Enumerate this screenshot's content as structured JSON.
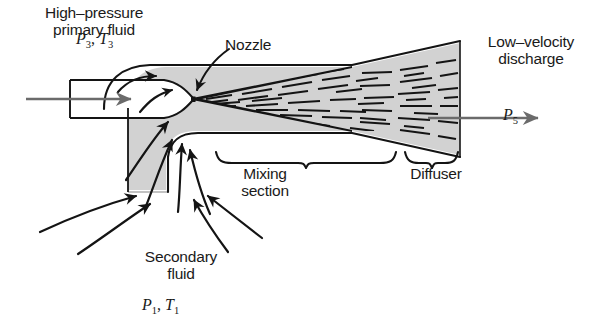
{
  "diagram": {
    "fill_color": "#d2d2d2",
    "line_color": "#1a1a1a",
    "arrow_color": "#6b6b6b",
    "background": "#ffffff"
  },
  "labels": {
    "high_pressure_line1": "High–pressure",
    "high_pressure_line2": "primary fluid",
    "nozzle": "Nozzle",
    "low_velocity_line1": "Low–velocity",
    "low_velocity_line2": "discharge",
    "mixing_line1": "Mixing",
    "mixing_line2": "section",
    "diffuser": "Diffuser",
    "secondary_line1": "Secondary",
    "secondary_line2": "fluid"
  },
  "symbols": {
    "primary_pressure": "P",
    "primary_pressure_sub": "3",
    "primary_temp": "T",
    "primary_temp_sub": "3",
    "secondary_pressure": "P",
    "secondary_pressure_sub": "1",
    "secondary_temp": "T",
    "secondary_temp_sub": "1",
    "discharge_pressure": "P",
    "discharge_pressure_sub": "5",
    "separator": ", "
  },
  "callouts": [
    {
      "name": "nozzle-leader",
      "from": [
        228,
        48
      ],
      "to": [
        196,
        92
      ]
    },
    {
      "name": "mixing-brace",
      "span": [
        215,
        396
      ],
      "y": 152
    },
    {
      "name": "diffuser-brace",
      "span": [
        404,
        458
      ],
      "y": 152
    }
  ],
  "flow_arrows": [
    {
      "name": "primary-inlet-arrow",
      "from": [
        26,
        99
      ],
      "to": [
        133,
        99
      ]
    },
    {
      "name": "discharge-arrow",
      "from": [
        428,
        118
      ],
      "to": [
        540,
        118
      ]
    }
  ]
}
